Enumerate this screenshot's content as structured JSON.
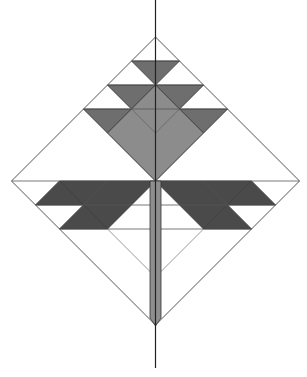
{
  "diagram": {
    "title": "Geometric quilt-block tree pattern inside a diamond",
    "colors": {
      "background": "#ffffff",
      "outline": "#555555",
      "axis": "#222222",
      "dark": "#4a4a4a",
      "medium": "#6e6e6e",
      "light": "#8c8c8c",
      "stem": "#8e8e8e"
    },
    "geometry": {
      "center": [
        155.5,
        181
      ],
      "unit": 24,
      "half_size_units": 6,
      "axis_top": 0,
      "axis_bottom": 368
    },
    "shapes": [
      {
        "name": "top-tier-triangle",
        "fill": "medium",
        "points": [
          [
            -1,
            -5
          ],
          [
            1,
            -5
          ],
          [
            0,
            -4
          ]
        ]
      },
      {
        "name": "second-tier-left-triangle",
        "fill": "medium",
        "points": [
          [
            -2,
            -4
          ],
          [
            0,
            -4
          ],
          [
            -1,
            -3
          ]
        ]
      },
      {
        "name": "second-tier-right-triangle",
        "fill": "medium",
        "points": [
          [
            0,
            -4
          ],
          [
            2,
            -4
          ],
          [
            1,
            -3
          ]
        ]
      },
      {
        "name": "third-tier-left-triangle",
        "fill": "medium",
        "points": [
          [
            -3,
            -3
          ],
          [
            -1,
            -3
          ],
          [
            -2,
            -2
          ]
        ]
      },
      {
        "name": "third-tier-right-triangle",
        "fill": "medium",
        "points": [
          [
            1,
            -3
          ],
          [
            3,
            -3
          ],
          [
            2,
            -2
          ]
        ]
      },
      {
        "name": "crown-diamond",
        "fill": "light",
        "points": [
          [
            0,
            -4
          ],
          [
            -1,
            -3
          ],
          [
            -2,
            -2
          ],
          [
            0,
            0
          ],
          [
            2,
            -2
          ],
          [
            1,
            -3
          ]
        ]
      },
      {
        "name": "left-arm-main",
        "fill": "dark",
        "points": [
          [
            -4,
            0
          ],
          [
            0,
            0
          ],
          [
            -2,
            2
          ],
          [
            -3,
            1
          ]
        ]
      },
      {
        "name": "left-arm-outer-triangle",
        "fill": "dark",
        "points": [
          [
            -4,
            0
          ],
          [
            -3,
            1
          ],
          [
            -5,
            1
          ]
        ]
      },
      {
        "name": "left-arm-lower-triangle",
        "fill": "dark",
        "points": [
          [
            -3,
            1
          ],
          [
            -2,
            2
          ],
          [
            -4,
            2
          ]
        ]
      },
      {
        "name": "right-arm-main",
        "fill": "dark",
        "points": [
          [
            4,
            0
          ],
          [
            0,
            0
          ],
          [
            2,
            2
          ],
          [
            3,
            1
          ]
        ]
      },
      {
        "name": "right-arm-outer-triangle",
        "fill": "dark",
        "points": [
          [
            4,
            0
          ],
          [
            3,
            1
          ],
          [
            5,
            1
          ]
        ]
      },
      {
        "name": "right-arm-lower-triangle",
        "fill": "dark",
        "points": [
          [
            3,
            1
          ],
          [
            2,
            2
          ],
          [
            4,
            2
          ]
        ]
      }
    ],
    "guide_lines": [
      {
        "name": "row-minus5",
        "y": -5
      },
      {
        "name": "row-minus4",
        "y": -4
      },
      {
        "name": "row-minus3",
        "y": -3
      },
      {
        "name": "row-0",
        "y": 0
      },
      {
        "name": "row-1",
        "y": 1
      },
      {
        "name": "row-2",
        "y": 2
      }
    ],
    "stem": {
      "x_left": 150,
      "x_right": 161,
      "y_top": 181,
      "y_bottom": 326
    }
  }
}
